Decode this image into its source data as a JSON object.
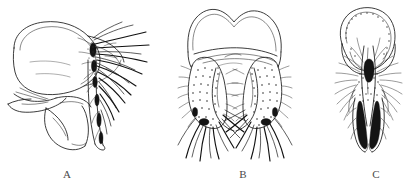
{
  "figure": {
    "type": "scientific-illustration-plate",
    "background_color": "#ffffff",
    "ink_color": "#1a1a1a",
    "label_color": "#4a4a4a",
    "panels": [
      {
        "id": "A",
        "label": "A",
        "view": "lateral view",
        "label_x": 67,
        "label_y": 168,
        "art_box": {
          "x": 6,
          "y": 18,
          "width": 142,
          "height": 140
        },
        "description": "large rounded dorsal lobe with double outline, ventral plates below, dense cluster of long bristles projecting to the right"
      },
      {
        "id": "B",
        "label": "B",
        "view": "ventral view",
        "label_x": 243,
        "label_y": 168,
        "art_box": {
          "x": 176,
          "y": 8,
          "width": 130,
          "height": 155
        },
        "description": "bilobed notched dorsal margin, two stippled setose arms, long curved bristles splaying from the arm tips"
      },
      {
        "id": "C",
        "label": "C",
        "view": "dorsal view",
        "label_x": 376,
        "label_y": 168,
        "art_box": {
          "x": 330,
          "y": 10,
          "width": 80,
          "height": 150
        },
        "description": "shield shaped dorsal plate with dotted margin, narrow median rod, paired dark elongate claspers, radiating setae"
      }
    ]
  }
}
